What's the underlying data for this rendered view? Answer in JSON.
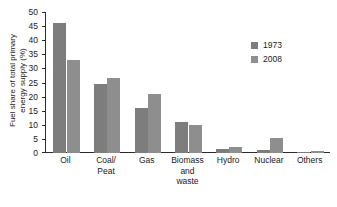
{
  "chart_data": {
    "type": "bar",
    "title": "",
    "xlabel": "",
    "ylabel": "Fuel share of total primary energy supply (%)",
    "ylabel_line1": "Fuel share of total primary",
    "ylabel_line2": "energy supply (%)",
    "categories": [
      "Oil",
      "Coal/ Peat",
      "Gas",
      "Biomass and waste",
      "Hydro",
      "Nuclear",
      "Others"
    ],
    "category_lines": [
      [
        "Oil"
      ],
      [
        "Coal/",
        "Peat"
      ],
      [
        "Gas"
      ],
      [
        "Biomass",
        "and",
        "waste"
      ],
      [
        "Hydro"
      ],
      [
        "Nuclear"
      ],
      [
        "Others"
      ]
    ],
    "series": [
      {
        "name": "1973",
        "color": "#7d7d7d",
        "values": [
          46.1,
          24.5,
          15.8,
          10.9,
          1.5,
          0.9,
          0.1
        ]
      },
      {
        "name": "2008",
        "color": "#8e8e8e",
        "values": [
          33.0,
          26.7,
          21.0,
          10.0,
          2.2,
          5.4,
          0.7
        ]
      }
    ],
    "ylim": [
      0,
      50
    ],
    "yticks": [
      0,
      5,
      10,
      15,
      20,
      25,
      30,
      35,
      40,
      45,
      50
    ],
    "ytick_labels": [
      "0",
      "5",
      "10",
      "15",
      "20",
      "25",
      "30",
      "35",
      "40",
      "45",
      "50"
    ],
    "grid": false,
    "legend_position": "top-right",
    "legend_entries": [
      {
        "label": "1973",
        "color": "#7d7d7d"
      },
      {
        "label": "2008",
        "color": "#8e8e8e"
      }
    ]
  }
}
